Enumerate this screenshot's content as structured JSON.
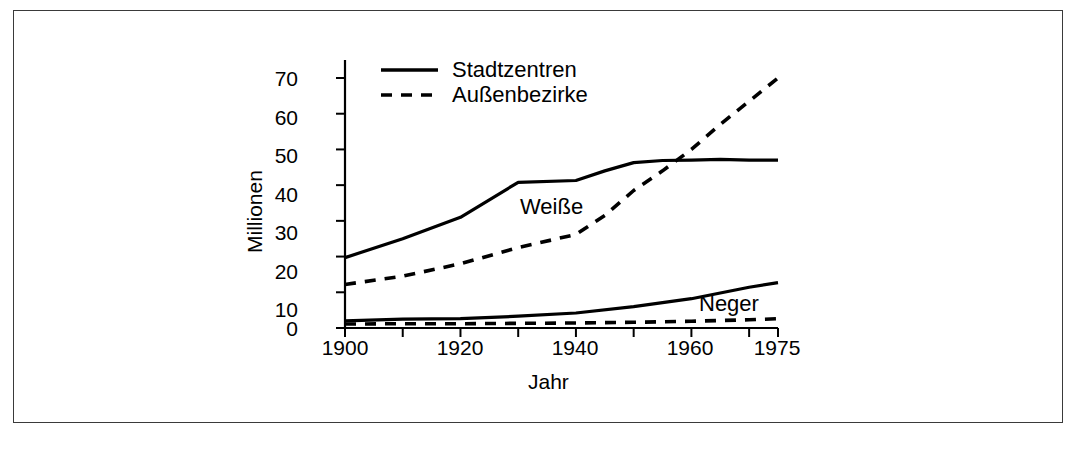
{
  "figure": {
    "border_color": "#3a3a3a",
    "background": "#ffffff",
    "line_color": "#000000"
  },
  "chart_data": {
    "type": "line",
    "title": "",
    "subtitle": "",
    "xlabel": "Jahr",
    "ylabel": "Millionen",
    "xlim": [
      1900,
      1975
    ],
    "ylim": [
      0,
      75
    ],
    "xticks": [
      1900,
      1910,
      1920,
      1930,
      1940,
      1950,
      1960,
      1970
    ],
    "xticklabels_shown": [
      "1900",
      "1920",
      "1940",
      "1960",
      "1975"
    ],
    "xticklabel_values": [
      1900,
      1920,
      1940,
      1960,
      1975
    ],
    "yticks": [
      0,
      10,
      20,
      30,
      40,
      50,
      60,
      70
    ],
    "yticklabels": [
      "0",
      "10",
      "20",
      "30",
      "40",
      "50",
      "60",
      "70"
    ],
    "grid": false,
    "legend_position": "top-center",
    "legend": [
      {
        "label": "Stadtzentren",
        "style": "solid"
      },
      {
        "label": "Außenbezirke",
        "style": "dashed"
      }
    ],
    "annotations": [
      {
        "text": "Weiße",
        "x": 1941,
        "y": 33
      },
      {
        "text": "Neger",
        "x": 1966,
        "y": 9
      }
    ],
    "series": [
      {
        "name": "Weiße – Stadtzentren",
        "group": "Weiße",
        "style": "solid",
        "x": [
          1900,
          1910,
          1920,
          1930,
          1940,
          1945,
          1950,
          1955,
          1960,
          1965,
          1970,
          1975
        ],
        "values": [
          19.7,
          25.0,
          31.0,
          40.8,
          41.3,
          44.0,
          46.3,
          46.9,
          47.0,
          47.2,
          47.0,
          47.0
        ]
      },
      {
        "name": "Weiße – Außenbezirke",
        "group": "Weiße",
        "style": "dashed",
        "x": [
          1900,
          1910,
          1920,
          1930,
          1940,
          1945,
          1950,
          1955,
          1960,
          1965,
          1970,
          1975
        ],
        "values": [
          12.2,
          14.5,
          18.0,
          22.5,
          26.2,
          31.5,
          38.5,
          44.0,
          50.0,
          57.0,
          63.5,
          70.0
        ]
      },
      {
        "name": "Neger – Stadtzentren",
        "group": "Neger",
        "style": "solid",
        "x": [
          1900,
          1910,
          1920,
          1930,
          1940,
          1950,
          1960,
          1970,
          1975
        ],
        "values": [
          2.0,
          2.5,
          2.6,
          3.3,
          4.2,
          6.0,
          8.2,
          11.4,
          12.7
        ]
      },
      {
        "name": "Neger – Außenbezirke",
        "group": "Neger",
        "style": "dashed",
        "x": [
          1900,
          1910,
          1920,
          1930,
          1940,
          1950,
          1960,
          1970,
          1975
        ],
        "values": [
          1.1,
          1.2,
          1.2,
          1.3,
          1.4,
          1.6,
          1.9,
          2.3,
          2.6
        ]
      }
    ]
  }
}
